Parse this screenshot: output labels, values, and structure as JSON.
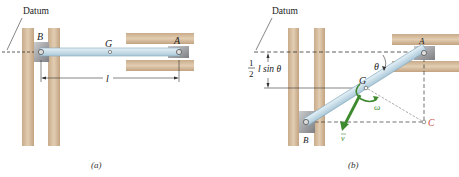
{
  "figure_a": {
    "datum_label": "Datum",
    "point_B": "B",
    "point_G": "G",
    "point_A": "A",
    "length_label": "l",
    "caption": "(a)"
  },
  "figure_b": {
    "datum_label": "Datum",
    "point_A": "A",
    "point_B": "B",
    "point_G": "G",
    "point_C": "C",
    "angle_label": "θ",
    "omega_label": "ω",
    "velocity_label": "v",
    "height_frac_num": "1",
    "height_frac_den": "2",
    "height_label": "l sin θ",
    "caption": "(b)"
  },
  "colors": {
    "wall": "#d9c2a6",
    "wall_edge": "#b89d7e",
    "rod": "#cde3ee",
    "rod_edge": "#7fa3b8",
    "block": "#a7a9ab",
    "arrow_green": "#3e8a2e",
    "point_C": "#d0403a"
  }
}
